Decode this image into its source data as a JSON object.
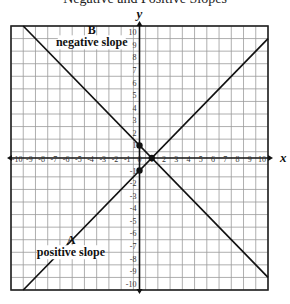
{
  "header": {
    "cutoff_text": "Negative and Positive Slopes"
  },
  "chart_data": {
    "type": "line",
    "title": "",
    "xlabel": "x",
    "ylabel": "y",
    "xlim": [
      -10.5,
      10.5
    ],
    "ylim": [
      -10.5,
      10.5
    ],
    "grid": true,
    "x_ticks": [
      -10,
      -9,
      -8,
      -7,
      -6,
      -5,
      -4,
      -3,
      -2,
      -1,
      0,
      1,
      2,
      3,
      4,
      5,
      6,
      7,
      8,
      9,
      10
    ],
    "y_ticks": [
      -10,
      -9,
      -8,
      -7,
      -6,
      -5,
      -4,
      -3,
      -2,
      -1,
      1,
      2,
      3,
      4,
      5,
      6,
      7,
      8,
      9,
      10
    ],
    "series": [
      {
        "name": "A positive slope",
        "equation": "y = x - 1",
        "x": [
          -9.5,
          10.5
        ],
        "y": [
          -10.5,
          9.5
        ]
      },
      {
        "name": "B negative slope",
        "equation": "y = -x + 1",
        "x": [
          -9.5,
          10.5
        ],
        "y": [
          10.5,
          -9.5
        ]
      }
    ],
    "points": [
      {
        "x": 0,
        "y": 1
      },
      {
        "x": 1,
        "y": 0
      },
      {
        "x": 0,
        "y": -1
      }
    ],
    "annotations": [
      {
        "letter": "B",
        "text": "negative slope",
        "x": -3.9,
        "y": 9.6
      },
      {
        "letter": "A",
        "text": "positive slope",
        "x": -5.6,
        "y": -7.1
      }
    ]
  },
  "labels": {
    "x_axis": "x",
    "y_axis": "y",
    "annotation_b_letter": "B",
    "annotation_b_text": "negative slope",
    "annotation_a_letter": "A",
    "annotation_a_text": "positive slope"
  }
}
